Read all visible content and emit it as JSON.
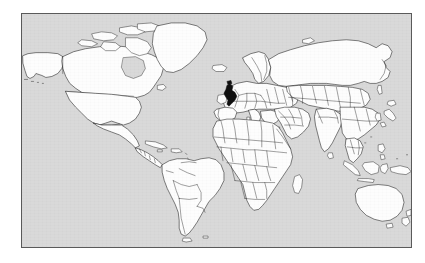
{
  "figure": {
    "type": "world-locator-map",
    "title": "",
    "projection": "equirectangular",
    "frame": {
      "x": 21,
      "y": 13,
      "width": 391,
      "height": 235,
      "border_color": "#5a5a5a"
    },
    "page_background": "#ffffff"
  },
  "legend": {
    "ocean_label": "Ocean",
    "land_label": "Land",
    "highlight_label": "Highlighted country",
    "visible": false
  },
  "colors": {
    "ocean": "#d9d9d9",
    "land": "#fdfdfd",
    "border": "#1a1a1a",
    "highlight": "#101010",
    "frame": "#5a5a5a",
    "page": "#ffffff"
  },
  "highlight": {
    "country": "United Kingdom",
    "fill": "#101010",
    "approx_screen_x": 209,
    "approx_screen_y": 93
  },
  "regions": [
    {
      "name": "North America",
      "visible": true
    },
    {
      "name": "Greenland",
      "visible": true
    },
    {
      "name": "South America",
      "visible": true
    },
    {
      "name": "Europe",
      "visible": true
    },
    {
      "name": "Africa",
      "visible": true
    },
    {
      "name": "Asia",
      "visible": true
    },
    {
      "name": "Australia",
      "visible": true
    },
    {
      "name": "New Zealand",
      "visible": true
    },
    {
      "name": "Madagascar",
      "visible": true
    },
    {
      "name": "Indonesia",
      "visible": true
    },
    {
      "name": "Japan",
      "visible": true
    },
    {
      "name": "Iceland",
      "visible": true
    },
    {
      "name": "Antarctica",
      "visible": false
    }
  ],
  "annotations": []
}
